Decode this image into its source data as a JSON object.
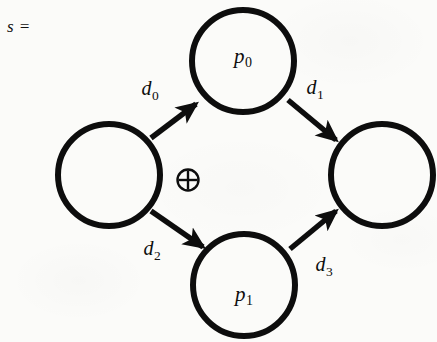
{
  "figure": {
    "prefix": "s =",
    "type": "directed-graph",
    "notation": "petri-net-style sequence with XOR split/join",
    "background_color": "#fbfbf9",
    "stroke_color": "#0d0d0d",
    "stroke_width": 5.5
  },
  "nodes": [
    {
      "id": "source",
      "label": "",
      "sub": "",
      "cx": 109,
      "cy": 175,
      "r": 53
    },
    {
      "id": "p0",
      "label": "p",
      "sub": "0",
      "cx": 243,
      "cy": 61,
      "r": 53
    },
    {
      "id": "p1",
      "label": "p",
      "sub": "1",
      "cx": 244,
      "cy": 285,
      "r": 53
    },
    {
      "id": "sink",
      "label": "",
      "sub": "",
      "cx": 382,
      "cy": 175,
      "r": 52
    }
  ],
  "edges": [
    {
      "id": "d0",
      "label": "d",
      "sub": "0",
      "from": "source",
      "to": "p0",
      "lx": 150,
      "ly": 90
    },
    {
      "id": "d1",
      "label": "d",
      "sub": "1",
      "from": "p0",
      "to": "sink",
      "lx": 315,
      "ly": 89
    },
    {
      "id": "d2",
      "label": "d",
      "sub": "2",
      "from": "source",
      "to": "p1",
      "lx": 152,
      "ly": 250
    },
    {
      "id": "d3",
      "label": "d",
      "sub": "3",
      "from": "p1",
      "to": "sink",
      "lx": 324,
      "ly": 266
    }
  ],
  "operators": [
    {
      "id": "xor",
      "symbol": "xor-circle-plus-icon",
      "cx": 188,
      "cy": 180,
      "r": 11
    }
  ]
}
